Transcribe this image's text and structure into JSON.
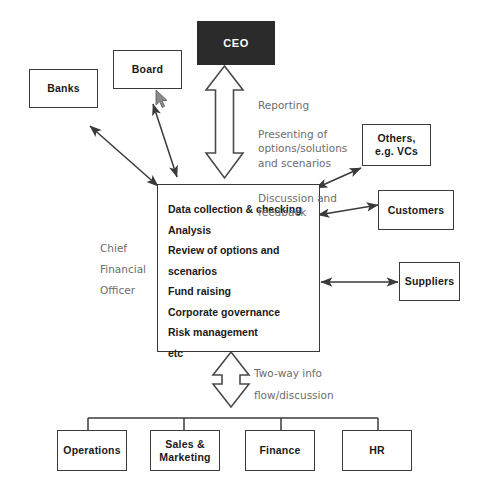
{
  "diagram": {
    "colors": {
      "background": "#ffffff",
      "box_border": "#3a3a3a",
      "box_fill": "#ffffff",
      "ceo_fill": "#2b2b2b",
      "ceo_text": "#ffffff",
      "label_text": "#1a1a1a",
      "annotation_text": "#6d6d6d",
      "arrow": "#3a3a3a"
    },
    "boxes": {
      "ceo": "CEO",
      "board": "Board",
      "banks": "Banks",
      "others": "Others,\ne.g. VCs",
      "customers": "Customers",
      "suppliers": "Suppliers",
      "operations": "Operations",
      "sales_marketing": "Sales &\nMarketing",
      "finance": "Finance",
      "hr": "HR"
    },
    "cfo": {
      "role_label": "Chief\nFinancial\nOfficer",
      "items": [
        "Data collection & checking",
        "Analysis",
        "Review of options and",
        "scenarios",
        "Fund raising",
        "Corporate governance",
        "Risk management",
        "etc"
      ]
    },
    "annotations": {
      "ceo_flow_line1": "Reporting",
      "ceo_flow_line2": "Presenting of\noptions/solutions\nand scenarios",
      "ceo_flow_line3": "Discussion and\nfeedback",
      "departments_flow": "Two-way info\nflow/discussion"
    },
    "cursor": {
      "name": "mouse-pointer",
      "x": 155,
      "y": 89
    }
  }
}
